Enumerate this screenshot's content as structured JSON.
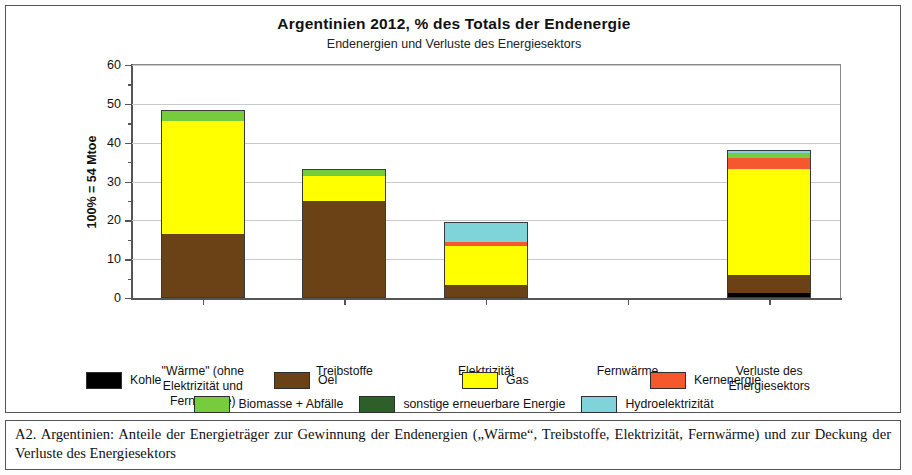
{
  "figure": {
    "title": "Argentinien  2012, % des Totals der Endenergie",
    "subtitle": "Endenergien und Verluste des Energiesektors",
    "caption": "A2.  Argentinien:  Anteile der Energieträger zur Gewinnung der Endenergien („Wärme“, Treibstoffe, Elektrizität, Fernwärme) und zur Deckung der Verluste des Energiesektors"
  },
  "legend": {
    "row1": [
      {
        "label": "Kohle",
        "color": "#000000"
      },
      {
        "label": "Oel",
        "color": "#6b4216"
      },
      {
        "label": "Gas",
        "color": "#ffff00"
      },
      {
        "label": "Kernenergie",
        "color": "#f4582c"
      }
    ],
    "row2": [
      {
        "label": "Biomasse + Abfälle",
        "color": "#77cc3d"
      },
      {
        "label": "sonstige erneuerbare Energie",
        "color": "#2e5e2a"
      },
      {
        "label": "Hydroelektrizität",
        "color": "#7fd4d9"
      }
    ]
  },
  "chart_data": {
    "type": "bar",
    "stacked": true,
    "title": "Argentinien  2012, % des Totals der Endenergie",
    "subtitle": "Endenergien und Verluste des Energiesektors",
    "xlabel": "",
    "ylabel": "100% = 54 Mtoe",
    "ylim": [
      0,
      60
    ],
    "yticks": [
      0,
      10,
      20,
      30,
      40,
      50,
      60
    ],
    "ytick_labels": [
      "0",
      "10",
      "20",
      "30",
      "40",
      "50",
      "60"
    ],
    "yminor_step": 5,
    "grid": "horizontal",
    "legend_position": "bottom",
    "units": "% des Totals der Endenergie (100% = 54 Mtoe)",
    "categories": [
      "\"Wärme\" (ohne\nElektrizität und\nFernwärme)",
      "Treibstoffe",
      "Elektrizität",
      "Fernwärme",
      "Verluste des\nEnergiesektors"
    ],
    "category_lines": [
      [
        "\"Wärme\" (ohne",
        "Elektrizität und",
        "Fernwärme)"
      ],
      [
        "Treibstoffe"
      ],
      [
        "Elektrizität"
      ],
      [
        "Fernwärme"
      ],
      [
        "Verluste des",
        "Energiesektors"
      ]
    ],
    "series": [
      {
        "name": "Kohle",
        "color": "#000000",
        "values": [
          0,
          0,
          0,
          0,
          1.2
        ]
      },
      {
        "name": "Oel",
        "color": "#6b4216",
        "values": [
          16.5,
          25.0,
          3.3,
          0,
          4.6
        ]
      },
      {
        "name": "Gas",
        "color": "#ffff00",
        "values": [
          29.0,
          6.5,
          10.2,
          0,
          27.4
        ]
      },
      {
        "name": "Kernenergie",
        "color": "#f4582c",
        "values": [
          0,
          0,
          0.8,
          0,
          2.8
        ]
      },
      {
        "name": "Biomasse + Abfälle",
        "color": "#77cc3d",
        "values": [
          2.6,
          1.8,
          0,
          0,
          1.3
        ]
      },
      {
        "name": "sonstige erneuerbare Energie",
        "color": "#2e5e2a",
        "values": [
          0.4,
          0,
          0,
          0,
          0
        ]
      },
      {
        "name": "Hydroelektrizität",
        "color": "#7fd4d9",
        "values": [
          0,
          0,
          5.2,
          0,
          0.7
        ]
      }
    ],
    "totals": [
      48.5,
      33.3,
      19.5,
      0,
      38.0
    ]
  }
}
